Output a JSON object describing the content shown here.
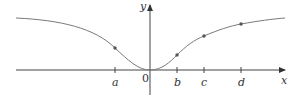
{
  "figure": {
    "axes": {
      "x_label": "x",
      "y_label": "y",
      "origin_label": "0"
    },
    "ticks": [
      {
        "label": "a",
        "x": 115
      },
      {
        "label": "b",
        "x": 177
      },
      {
        "label": "c",
        "x": 204
      },
      {
        "label": "d",
        "x": 241
      }
    ],
    "points": [
      {
        "name": "a",
        "x": 115,
        "y": 48
      },
      {
        "name": "b",
        "x": 177,
        "y": 55
      },
      {
        "name": "c",
        "x": 204,
        "y": 36
      },
      {
        "name": "d",
        "x": 241,
        "y": 24
      }
    ],
    "colors": {
      "curve": "#7a7a7a",
      "axis": "#444444",
      "point": "#555555",
      "text": "#333333"
    }
  }
}
